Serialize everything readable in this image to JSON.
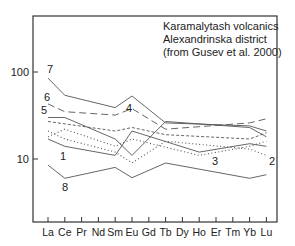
{
  "chart_data": {
    "type": "line",
    "title": "Karamalytash volcanics Alexandrinska district (from Gusev et al. 2000)",
    "title_lines": [
      "Karamalytash volcanics",
      "Alexandrinska district",
      "(from Gusev et al. 2000)"
    ],
    "xlabel": "",
    "ylabel": "",
    "yscale": "log",
    "ylim": [
      2.1,
      350
    ],
    "yticks": [
      10,
      100
    ],
    "ytick_labels": [
      "10",
      "100"
    ],
    "categories": [
      "La",
      "Ce",
      "Pr",
      "Nd",
      "Sm",
      "Eu",
      "Gd",
      "Tb",
      "Dy",
      "Ho",
      "Er",
      "Tm",
      "Yb",
      "Lu"
    ],
    "grid": false,
    "legend": "none (series labelled inline by number)",
    "series": [
      {
        "name": "7",
        "style": "solid",
        "points": {
          "La": 85,
          "Ce": 54,
          "Sm": 39,
          "Eu": 53,
          "Tb": 26,
          "Yb": 24,
          "Lu": 21
        }
      },
      {
        "name": "6",
        "style": "long-dash",
        "points": {
          "La": 43,
          "Ce": 35,
          "Sm": 32,
          "Eu": 38,
          "Tb": 22,
          "Yb": 26,
          "Lu": 29
        }
      },
      {
        "name": "5",
        "style": "solid",
        "points": {
          "La": 30,
          "Ce": 30,
          "Sm": 17,
          "Eu": 11,
          "Tb": 27,
          "Yb": 23,
          "Lu": 18
        }
      },
      {
        "name": "4",
        "style": "short-dash",
        "points": {
          "La": 27,
          "Sm": 21,
          "Eu": 23,
          "Tb": 19,
          "Yb": 17,
          "Lu": 20
        }
      },
      {
        "name": "1",
        "style": "solid",
        "points": {
          "La": 17,
          "Ce": 14,
          "Sm": 11,
          "Eu": 21,
          "Ho": 12,
          "Yb": 15,
          "Lu": 14
        }
      },
      {
        "name": "2",
        "style": "dotted",
        "points": {
          "La": 21,
          "Ce": 17,
          "Sm": 12,
          "Eu": 9,
          "Tb": 16,
          "Yb": 13,
          "Lu": 11
        }
      },
      {
        "name": "3",
        "style": "dotted",
        "points": {
          "La": 18,
          "Ce": 22,
          "Sm": 14,
          "Eu": 17,
          "Ho": 11,
          "Yb": 14,
          "Lu": 16
        }
      },
      {
        "name": "8",
        "style": "solid",
        "points": {
          "La": 8.5,
          "Ce": 6.0,
          "Sm": 8.0,
          "Eu": 6.1,
          "Tb": 9.0,
          "Yb": 6.0,
          "Lu": 6.6
        }
      }
    ],
    "series_labels": [
      "7",
      "6",
      "5",
      "4",
      "1",
      "3",
      "2",
      "8"
    ]
  }
}
